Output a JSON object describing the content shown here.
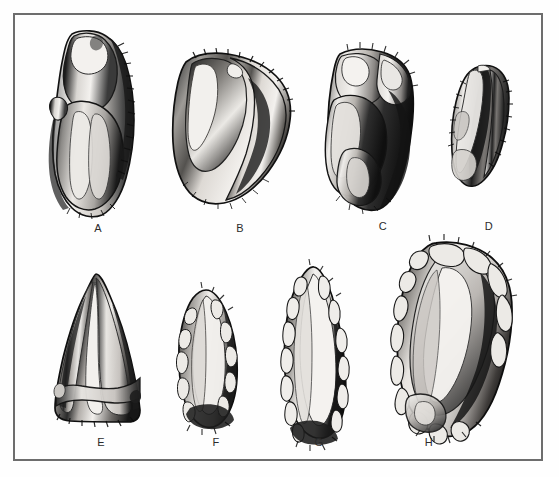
{
  "plate": {
    "background_color": "#fefefe",
    "frame_color": "#6d6d6d",
    "frame_width_px": 2,
    "width_px": 559,
    "height_px": 477,
    "subject": "lithic-artifact-illustration-plate",
    "style": "pen-and-ink shaded archaeological drawing"
  },
  "artifacts": [
    {
      "id": "A",
      "label": "A",
      "row": 1,
      "column": 1,
      "shape": "elongated-flake-blade",
      "label_x": 88,
      "label_y": 222,
      "box": {
        "x": 52,
        "y": 30,
        "w": 88,
        "h": 188
      }
    },
    {
      "id": "B",
      "label": "B",
      "row": 1,
      "column": 2,
      "shape": "broad-side-scraper",
      "label_x": 230,
      "label_y": 222,
      "box": {
        "x": 168,
        "y": 52,
        "w": 120,
        "h": 160
      }
    },
    {
      "id": "C",
      "label": "C",
      "row": 1,
      "column": 3,
      "shape": "steep-retouched-core-fragment",
      "label_x": 373,
      "label_y": 220,
      "box": {
        "x": 326,
        "y": 48,
        "w": 92,
        "h": 163
      }
    },
    {
      "id": "D",
      "label": "D",
      "row": 1,
      "column": 4,
      "shape": "small-backed-flake",
      "label_x": 479,
      "label_y": 220,
      "box": {
        "x": 452,
        "y": 66,
        "w": 58,
        "h": 125
      }
    },
    {
      "id": "E",
      "label": "E",
      "row": 2,
      "column": 1,
      "shape": "triangular-point",
      "label_x": 91,
      "label_y": 436,
      "box": {
        "x": 50,
        "y": 272,
        "w": 93,
        "h": 152
      }
    },
    {
      "id": "F",
      "label": "F",
      "row": 2,
      "column": 2,
      "shape": "small-leaf-point",
      "label_x": 206,
      "label_y": 436,
      "box": {
        "x": 176,
        "y": 288,
        "w": 62,
        "h": 140
      }
    },
    {
      "id": "G",
      "label": "G",
      "row": 2,
      "column": 3,
      "shape": "elongated-leaf-point",
      "label_x": 309,
      "label_y": 436,
      "box": {
        "x": 281,
        "y": 265,
        "w": 66,
        "h": 166
      }
    },
    {
      "id": "H",
      "label": "H",
      "row": 2,
      "column": 4,
      "shape": "large-ovate-biface",
      "label_x": 419,
      "label_y": 436,
      "box": {
        "x": 397,
        "y": 241,
        "w": 114,
        "h": 193
      }
    }
  ],
  "palette": {
    "ink_darkest": "#0d0d0d",
    "ink_dark": "#2a2a2a",
    "ink_mid": "#5a5a5a",
    "ink_light": "#9d9d9d",
    "highlight": "#f4f2ef",
    "paper": "#fefefe"
  }
}
